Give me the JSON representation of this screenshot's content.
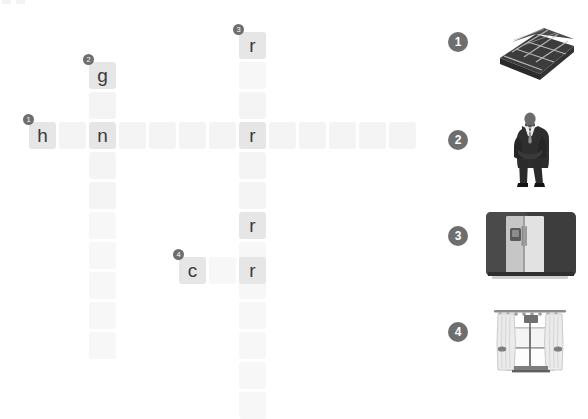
{
  "puzzle": {
    "type": "picture-crossword",
    "cell_size": 27,
    "cell_pitch": 30,
    "empty_cell_color": "#f4f4f4",
    "filled_cell_color": "#e6e6e6",
    "letter_color": "#3b3b3b",
    "badge_color": "#6e6e6e"
  },
  "entries": [
    {
      "number": "1",
      "direction": "across",
      "length": 13,
      "start": {
        "col": 0,
        "row": 0
      },
      "letters": [
        "h",
        "",
        "n",
        "",
        "",
        "",
        "",
        "r",
        "",
        "",
        "",
        "",
        ""
      ]
    },
    {
      "number": "2",
      "direction": "down",
      "length": 10,
      "start": {
        "col": 2,
        "row": -2
      },
      "letters": [
        "g",
        "",
        "n",
        "",
        "",
        "",
        "",
        "",
        "",
        ""
      ]
    },
    {
      "number": "3",
      "direction": "down",
      "length": 13,
      "start": {
        "col": 7,
        "row": -3
      },
      "letters": [
        "r",
        "",
        "",
        "r",
        "",
        "",
        "r",
        "",
        "",
        "",
        "",
        "",
        ""
      ]
    },
    {
      "number": "4",
      "direction": "across",
      "length": 3,
      "start": {
        "col": 5,
        "row": 4.5
      },
      "letters": [
        "c",
        "",
        "r"
      ]
    }
  ],
  "cells": [
    {
      "name": "cell-1-across-0",
      "x": 29,
      "y": 122,
      "letter": "h",
      "filled": true,
      "badge": "1"
    },
    {
      "name": "cell-1-across-1",
      "x": 59,
      "y": 122,
      "letter": "",
      "filled": false,
      "badge": ""
    },
    {
      "name": "cell-1-across-2",
      "x": 89,
      "y": 122,
      "letter": "n",
      "filled": true,
      "badge": ""
    },
    {
      "name": "cell-1-across-3",
      "x": 119,
      "y": 122,
      "letter": "",
      "filled": false,
      "badge": ""
    },
    {
      "name": "cell-1-across-4",
      "x": 149,
      "y": 122,
      "letter": "",
      "filled": false,
      "badge": ""
    },
    {
      "name": "cell-1-across-5",
      "x": 179,
      "y": 122,
      "letter": "",
      "filled": false,
      "badge": ""
    },
    {
      "name": "cell-1-across-6",
      "x": 209,
      "y": 122,
      "letter": "",
      "filled": false,
      "badge": ""
    },
    {
      "name": "cell-1-across-7",
      "x": 219,
      "y": 122,
      "letter": "r",
      "filled": true,
      "badge": ""
    },
    {
      "name": "cell-1-across-8",
      "x": 249,
      "y": 122,
      "letter": "",
      "filled": false,
      "badge": ""
    },
    {
      "name": "cell-1-across-9",
      "x": 279,
      "y": 122,
      "letter": "",
      "filled": false,
      "badge": ""
    },
    {
      "name": "cell-1-across-10",
      "x": 309,
      "y": 122,
      "letter": "",
      "filled": false,
      "badge": ""
    },
    {
      "name": "cell-1-across-11",
      "x": 339,
      "y": 122,
      "letter": "",
      "filled": false,
      "badge": ""
    },
    {
      "name": "cell-1-across-12",
      "x": 369,
      "y": 122,
      "letter": "",
      "filled": false,
      "badge": ""
    }
  ],
  "picture_clues": [
    {
      "number": "1",
      "icon": "folded-checkered-cloth-icon",
      "answer_initial": "h"
    },
    {
      "number": "2",
      "icon": "man-in-suit-icon",
      "answer_initial": "g"
    },
    {
      "number": "3",
      "icon": "refrigerator-icon",
      "answer_initial": "r"
    },
    {
      "number": "4",
      "icon": "curtained-window-icon",
      "answer_initial": "c"
    }
  ]
}
